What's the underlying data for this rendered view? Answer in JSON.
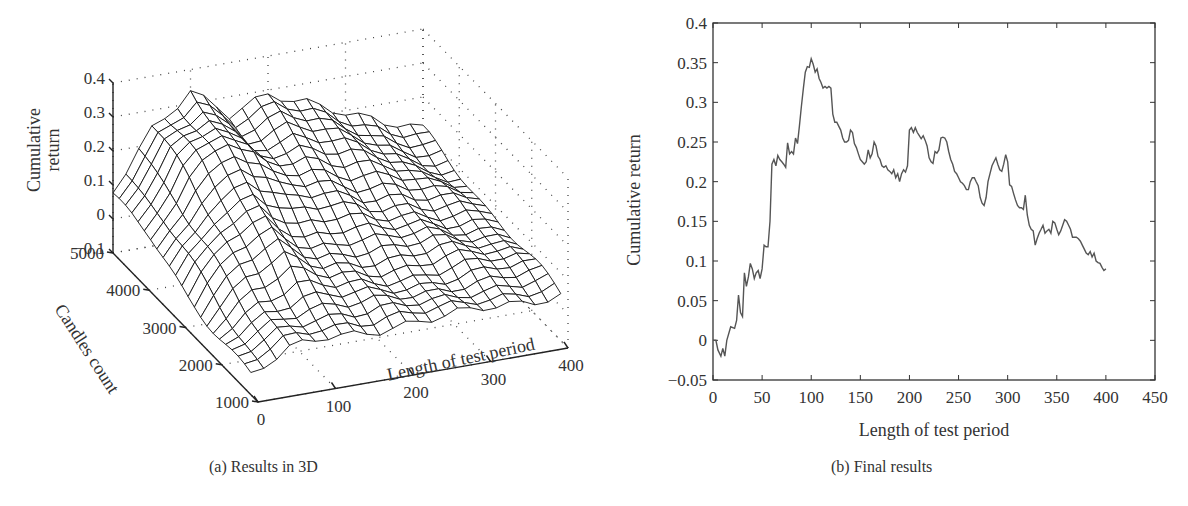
{
  "figure": {
    "panel_a": {
      "caption": "(a)  Results in 3D"
    },
    "panel_b": {
      "caption": "(b)  Final results"
    }
  },
  "chart_data": [
    {
      "type": "surface3d",
      "title": "",
      "caption": "(a)  Results in 3D",
      "xlabel": "Length of test period",
      "ylabel": "Candles count",
      "zlabel": "Cumulative return",
      "zlabel_lines": [
        "Cumulative",
        "return"
      ],
      "x_ticks": [
        "0",
        "100",
        "200",
        "300",
        "400"
      ],
      "y_ticks": [
        "1000",
        "2000",
        "3000",
        "4000",
        "5000"
      ],
      "z_ticks": [
        "-0.1",
        "0",
        "0.1",
        "0.2",
        "0.3",
        "0.4"
      ],
      "xlim": [
        0,
        400
      ],
      "ylim": [
        1000,
        5000
      ],
      "zlim": [
        -0.1,
        0.4
      ],
      "grid": true,
      "style": "black wireframe mesh on white, dotted gridlines",
      "x": [
        0,
        50,
        100,
        150,
        200,
        250,
        300,
        350,
        400
      ],
      "y": [
        1000,
        2000,
        3000,
        4000,
        5000
      ],
      "z": [
        [
          -0.05,
          0.0,
          0.02,
          0.02,
          0.02,
          0.02,
          0.03,
          0.03,
          0.03
        ],
        [
          -0.02,
          0.05,
          0.08,
          0.06,
          0.05,
          0.05,
          0.06,
          0.06,
          0.05
        ],
        [
          0.0,
          0.15,
          0.2,
          0.12,
          0.12,
          0.1,
          0.1,
          0.08,
          0.07
        ],
        [
          0.05,
          0.22,
          0.3,
          0.22,
          0.22,
          0.18,
          0.15,
          0.1,
          0.08
        ],
        [
          0.08,
          0.25,
          0.34,
          0.24,
          0.28,
          0.25,
          0.2,
          0.14,
          0.1
        ]
      ]
    },
    {
      "type": "line",
      "title": "",
      "caption": "(b)  Final results",
      "xlabel": "Length of test period",
      "ylabel": "Cumulative return",
      "xlim": [
        0,
        450
      ],
      "ylim": [
        -0.05,
        0.4
      ],
      "x_ticks": [
        "0",
        "50",
        "100",
        "150",
        "200",
        "250",
        "300",
        "350",
        "400",
        "450"
      ],
      "y_ticks": [
        "-0.05",
        "0",
        "0.05",
        "0.1",
        "0.15",
        "0.2",
        "0.25",
        "0.3",
        "0.35",
        "0.4"
      ],
      "grid": false,
      "legend": null,
      "series": [
        {
          "name": "Cumulative return",
          "color": "#555555",
          "x": [
            0,
            3,
            5,
            8,
            10,
            12,
            14,
            18,
            22,
            24,
            26,
            28,
            30,
            32,
            34,
            36,
            38,
            40,
            42,
            44,
            46,
            48,
            50,
            52,
            54,
            56,
            58,
            60,
            62,
            64,
            66,
            68,
            70,
            72,
            74,
            76,
            78,
            80,
            82,
            84,
            86,
            88,
            90,
            92,
            94,
            96,
            98,
            100,
            102,
            104,
            106,
            108,
            110,
            112,
            114,
            116,
            118,
            120,
            122,
            124,
            126,
            128,
            130,
            132,
            134,
            136,
            138,
            140,
            142,
            144,
            146,
            148,
            150,
            152,
            154,
            156,
            158,
            160,
            162,
            164,
            166,
            168,
            170,
            172,
            174,
            176,
            178,
            180,
            182,
            184,
            186,
            188,
            190,
            192,
            194,
            196,
            198,
            200,
            202,
            204,
            206,
            208,
            210,
            212,
            214,
            216,
            218,
            220,
            222,
            224,
            226,
            228,
            230,
            232,
            234,
            236,
            238,
            240,
            242,
            244,
            246,
            248,
            250,
            252,
            254,
            256,
            258,
            260,
            262,
            264,
            266,
            268,
            270,
            272,
            274,
            276,
            278,
            280,
            282,
            284,
            286,
            288,
            290,
            292,
            294,
            296,
            298,
            300,
            302,
            304,
            306,
            308,
            310,
            312,
            314,
            316,
            318,
            320,
            322,
            324,
            326,
            328,
            330,
            332,
            334,
            336,
            338,
            340,
            342,
            344,
            346,
            348,
            350,
            352,
            354,
            356,
            358,
            360,
            362,
            364,
            366,
            368,
            370,
            372,
            374,
            376,
            378,
            380,
            382,
            384,
            386,
            388,
            390,
            392,
            394,
            396,
            398,
            400
          ],
          "y": [
            0.0,
            0.0,
            -0.012,
            -0.02,
            -0.01,
            -0.02,
            0.0,
            0.017,
            0.015,
            0.025,
            0.057,
            0.035,
            0.03,
            0.085,
            0.068,
            0.08,
            0.097,
            0.09,
            0.078,
            0.085,
            0.088,
            0.078,
            0.09,
            0.12,
            0.118,
            0.118,
            0.15,
            0.222,
            0.228,
            0.22,
            0.233,
            0.228,
            0.225,
            0.222,
            0.218,
            0.249,
            0.235,
            0.238,
            0.235,
            0.255,
            0.248,
            0.27,
            0.295,
            0.318,
            0.338,
            0.345,
            0.344,
            0.355,
            0.348,
            0.338,
            0.342,
            0.33,
            0.325,
            0.318,
            0.32,
            0.318,
            0.32,
            0.318,
            0.285,
            0.275,
            0.275,
            0.27,
            0.265,
            0.255,
            0.25,
            0.25,
            0.252,
            0.265,
            0.262,
            0.248,
            0.243,
            0.235,
            0.228,
            0.225,
            0.222,
            0.225,
            0.24,
            0.23,
            0.235,
            0.25,
            0.245,
            0.232,
            0.228,
            0.22,
            0.218,
            0.22,
            0.215,
            0.213,
            0.21,
            0.215,
            0.205,
            0.21,
            0.2,
            0.21,
            0.215,
            0.212,
            0.22,
            0.265,
            0.268,
            0.262,
            0.268,
            0.262,
            0.258,
            0.254,
            0.258,
            0.252,
            0.245,
            0.23,
            0.225,
            0.223,
            0.238,
            0.236,
            0.24,
            0.255,
            0.256,
            0.255,
            0.25,
            0.238,
            0.228,
            0.222,
            0.213,
            0.21,
            0.205,
            0.2,
            0.198,
            0.195,
            0.19,
            0.19,
            0.2,
            0.205,
            0.205,
            0.2,
            0.195,
            0.18,
            0.173,
            0.17,
            0.18,
            0.2,
            0.21,
            0.22,
            0.225,
            0.23,
            0.222,
            0.215,
            0.213,
            0.222,
            0.234,
            0.225,
            0.196,
            0.194,
            0.185,
            0.177,
            0.17,
            0.167,
            0.167,
            0.165,
            0.183,
            0.158,
            0.145,
            0.14,
            0.138,
            0.12,
            0.128,
            0.135,
            0.14,
            0.145,
            0.135,
            0.138,
            0.14,
            0.135,
            0.15,
            0.148,
            0.14,
            0.133,
            0.138,
            0.145,
            0.152,
            0.15,
            0.145,
            0.14,
            0.13,
            0.13,
            0.13,
            0.128,
            0.125,
            0.12,
            0.115,
            0.11,
            0.108,
            0.112,
            0.105,
            0.11,
            0.1,
            0.098,
            0.097,
            0.092,
            0.088,
            0.09,
            0.087,
            0.085,
            0.088,
            0.08,
            0.07,
            0.065,
            0.072,
            0.063
          ]
        }
      ]
    }
  ]
}
